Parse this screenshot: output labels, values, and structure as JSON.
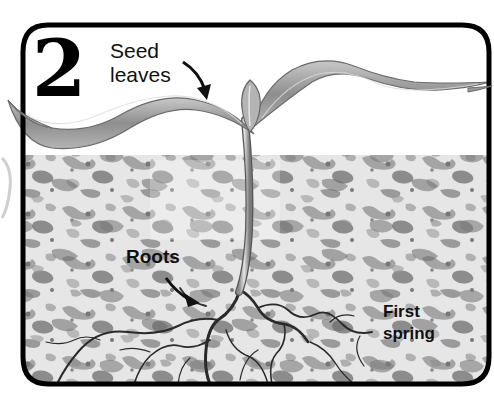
{
  "illustration": {
    "step_number": "2",
    "labels": {
      "seed_leaves_line1": "Seed",
      "seed_leaves_line2": "leaves",
      "roots": "Roots",
      "stage_line1": "First",
      "stage_line2": "spring"
    },
    "colors": {
      "frame": "#000000",
      "background": "#ffffff",
      "soil_light": "#e8e8e8",
      "soil_mid": "#a8a8a8",
      "soil_dark": "#6e6e6e",
      "leaf": "#9a9a9a",
      "root": "#2a2a2a"
    }
  }
}
